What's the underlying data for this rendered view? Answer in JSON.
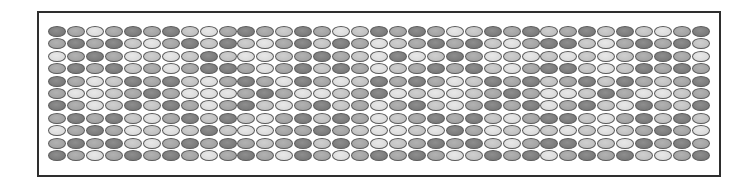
{
  "figure": {
    "rows": 11,
    "columns": 35,
    "tone_colors": {
      "D": "#7f7f7f",
      "M": "#a3a3a3",
      "L": "#c1c1c1",
      "W": "#dcdcdc"
    },
    "outline_color": "#5a5a5a",
    "frame_color": "#2e2e2e",
    "grid": [
      [
        "D",
        "M",
        "W",
        "M",
        "D",
        "M",
        "D",
        "L",
        "W",
        "M",
        "D",
        "M",
        "L",
        "D",
        "M",
        "W",
        "L",
        "D",
        "M",
        "D",
        "M",
        "W",
        "L",
        "D",
        "M",
        "D",
        "L",
        "M",
        "D",
        "L",
        "D",
        "L",
        "W",
        "M",
        "D"
      ],
      [
        "M",
        "D",
        "M",
        "D",
        "L",
        "W",
        "M",
        "D",
        "L",
        "D",
        "L",
        "W",
        "M",
        "D",
        "L",
        "D",
        "M",
        "W",
        "L",
        "M",
        "D",
        "M",
        "D",
        "L",
        "W",
        "M",
        "D",
        "D",
        "L",
        "W",
        "M",
        "D",
        "M",
        "D",
        "L"
      ],
      [
        "W",
        "M",
        "D",
        "M",
        "W",
        "L",
        "W",
        "L",
        "D",
        "L",
        "W",
        "W",
        "L",
        "M",
        "D",
        "M",
        "L",
        "W",
        "D",
        "W",
        "L",
        "D",
        "M",
        "W",
        "L",
        "W",
        "L",
        "W",
        "L",
        "W",
        "L",
        "M",
        "D",
        "M",
        "W"
      ],
      [
        "M",
        "D",
        "M",
        "D",
        "L",
        "M",
        "W",
        "M",
        "D",
        "D",
        "M",
        "W",
        "M",
        "D",
        "L",
        "D",
        "M",
        "W",
        "L",
        "M",
        "D",
        "M",
        "D",
        "L",
        "W",
        "M",
        "D",
        "D",
        "L",
        "W",
        "L",
        "D",
        "M",
        "D",
        "M"
      ],
      [
        "D",
        "M",
        "W",
        "L",
        "D",
        "M",
        "D",
        "L",
        "W",
        "M",
        "D",
        "M",
        "W",
        "D",
        "M",
        "W",
        "L",
        "D",
        "M",
        "D",
        "M",
        "W",
        "L",
        "D",
        "M",
        "D",
        "L",
        "M",
        "D",
        "L",
        "D",
        "M",
        "L",
        "M",
        "D"
      ],
      [
        "M",
        "W",
        "W",
        "L",
        "M",
        "D",
        "M",
        "W",
        "W",
        "W",
        "M",
        "D",
        "M",
        "W",
        "W",
        "L",
        "M",
        "D",
        "W",
        "L",
        "W",
        "W",
        "L",
        "M",
        "D",
        "M",
        "W",
        "W",
        "L",
        "D",
        "M",
        "W",
        "W",
        "L",
        "M"
      ],
      [
        "D",
        "M",
        "W",
        "L",
        "D",
        "L",
        "D",
        "M",
        "W",
        "M",
        "D",
        "L",
        "W",
        "M",
        "D",
        "L",
        "M",
        "W",
        "M",
        "D",
        "L",
        "W",
        "M",
        "D",
        "M",
        "D",
        "W",
        "M",
        "D",
        "L",
        "W",
        "D",
        "M",
        "L",
        "D"
      ],
      [
        "M",
        "D",
        "M",
        "D",
        "L",
        "W",
        "M",
        "D",
        "L",
        "D",
        "L",
        "W",
        "M",
        "D",
        "L",
        "D",
        "M",
        "W",
        "L",
        "M",
        "D",
        "M",
        "D",
        "L",
        "W",
        "M",
        "D",
        "D",
        "L",
        "W",
        "M",
        "D",
        "L",
        "D",
        "L"
      ],
      [
        "W",
        "M",
        "D",
        "M",
        "W",
        "L",
        "W",
        "L",
        "D",
        "L",
        "W",
        "W",
        "M",
        "M",
        "D",
        "M",
        "L",
        "W",
        "W",
        "L",
        "W",
        "D",
        "M",
        "W",
        "L",
        "W",
        "L",
        "W",
        "L",
        "W",
        "L",
        "M",
        "D",
        "M",
        "W"
      ],
      [
        "M",
        "D",
        "M",
        "D",
        "L",
        "W",
        "M",
        "D",
        "M",
        "D",
        "M",
        "L",
        "M",
        "D",
        "L",
        "D",
        "M",
        "W",
        "L",
        "M",
        "D",
        "M",
        "D",
        "L",
        "W",
        "M",
        "D",
        "D",
        "L",
        "L",
        "W",
        "D",
        "M",
        "D",
        "M"
      ],
      [
        "D",
        "M",
        "W",
        "M",
        "D",
        "M",
        "D",
        "M",
        "W",
        "M",
        "D",
        "M",
        "W",
        "D",
        "M",
        "W",
        "M",
        "D",
        "M",
        "D",
        "M",
        "W",
        "L",
        "D",
        "M",
        "D",
        "W",
        "M",
        "D",
        "M",
        "D",
        "L",
        "W",
        "M",
        "D"
      ]
    ]
  }
}
